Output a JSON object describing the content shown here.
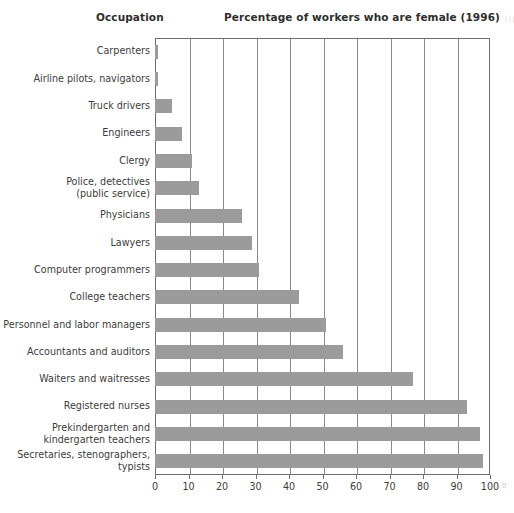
{
  "headings": {
    "occupation": "Occupation",
    "value": "Percentage of workers who are female (1996)"
  },
  "colors": {
    "bar": "#9b9b9b",
    "frame": "#6f6f6f",
    "gridline": "#8a8a8a",
    "text": "#3d3d3d",
    "background": "#ffffff"
  },
  "chart_data": {
    "type": "bar",
    "orientation": "horizontal",
    "title": "Percentage of workers who are female (1996)",
    "xlabel": "",
    "ylabel": "Occupation",
    "xlim": [
      0,
      100
    ],
    "xticks": [
      0,
      10,
      20,
      30,
      40,
      50,
      60,
      70,
      80,
      90,
      100
    ],
    "grid": "vertical",
    "legend": "none",
    "categories": [
      "Carpenters",
      "Airline pilots, navigators",
      "Truck drivers",
      "Engineers",
      "Clergy",
      "Police, detectives\n(public service)",
      "Physicians",
      "Lawyers",
      "Computer programmers",
      "College teachers",
      "Personnel and labor managers",
      "Accountants and auditors",
      "Waiters and waitresses",
      "Registered nurses",
      "Prekindergarten and\nkindergarten teachers",
      "Secretaries, stenographers,\ntypists"
    ],
    "values": [
      1,
      1,
      5,
      8,
      11,
      13,
      26,
      29,
      31,
      43,
      51,
      56,
      77,
      93,
      97,
      98
    ]
  },
  "page_edge": {
    "marginalia": "| | | | | | | | | |",
    "page_number": "0"
  }
}
